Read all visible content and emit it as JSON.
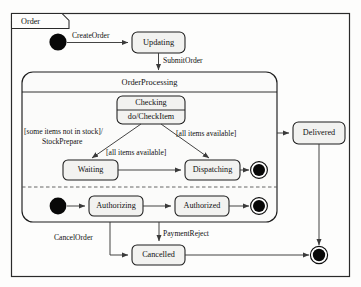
{
  "diagram": {
    "type": "uml-state-machine",
    "frame_name": "Order",
    "top_artifact": "",
    "composite": {
      "name": "OrderProcessing"
    },
    "states": {
      "updating": "Updating",
      "checking_name": "Checking",
      "checking_activity": "do/CheckItem",
      "waiting": "Waiting",
      "dispatching": "Dispatching",
      "authorizing": "Authorizing",
      "authorized": "Authorized",
      "delivered": "Delivered",
      "cancelled": "Cancelled"
    },
    "transitions": {
      "create_order": "CreateOrder",
      "submit_order": "SubmitOrder",
      "not_in_stock_guard": "[some items not in stock]/",
      "stock_prepare": "StockPrepare",
      "all_available_right": "[all items available]",
      "all_available_mid": "[all items available]",
      "cancel_order": "CancelOrder",
      "payment_reject": "PaymentReject"
    }
  }
}
